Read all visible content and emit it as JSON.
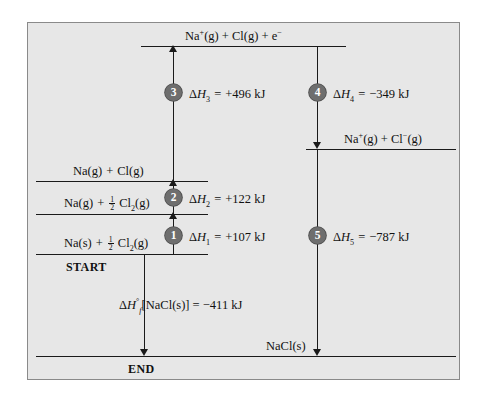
{
  "figure": {
    "type": "born-haber-cycle-energy-diagram",
    "background_color": "#e7e7e7",
    "border_color": "#8a8a8a",
    "line_color": "#1a1a1a",
    "badge_color": "#6e6e6e"
  },
  "levels": {
    "top": {
      "label_html": "Na<sup>+</sup>(g) + Cl(g) + e<sup>&minus;</sup>",
      "name": "Na+(g) + Cl(g) + e-"
    },
    "ion_pair": {
      "label_html": "Na<sup>+</sup>(g) + Cl<sup>&minus;</sup>(g)",
      "name": "Na+(g) + Cl-(g)"
    },
    "atoms": {
      "label_html": "Na(g)<span class=\"sp\"></span>+<span class=\"sp\"></span>Cl(g)",
      "name": "Na(g) + Cl(g)"
    },
    "na_gas": {
      "label_html": "Na(g)<span class=\"sp\"></span>+<span class=\"sp\"></span><span class=\"frac\"><span class=\"num\">1</span><span class=\"den\">2</span></span>&nbsp;Cl<sub>2</sub>(g)",
      "name": "Na(g) + 1/2 Cl2(g)"
    },
    "start": {
      "label_html": "Na(s)<span class=\"sp\"></span>+<span class=\"sp\"></span><span class=\"frac\"><span class=\"num\">1</span><span class=\"den\">2</span></span>&nbsp;Cl<sub>2</sub>(g)",
      "name": "Na(s) + 1/2 Cl2(g)"
    },
    "product": {
      "label_html": "NaCl(s)",
      "name": "NaCl(s)"
    }
  },
  "markers": {
    "start_label": "START",
    "end_label": "END"
  },
  "steps": [
    {
      "number": "1",
      "badge": "1",
      "label_html": "&Delta;<span class=\"it\">H</span><sub>1</sub><span class=\"sp\"></span>=<span class=\"sp\"></span>+107 kJ",
      "symbol": "ΔH1",
      "value": 107,
      "unit": "kJ",
      "sign": "+",
      "direction": "up",
      "name": "sublimation"
    },
    {
      "number": "2",
      "badge": "2",
      "label_html": "&Delta;<span class=\"it\">H</span><sub>2</sub><span class=\"sp\"></span>=<span class=\"sp\"></span>+122 kJ",
      "symbol": "ΔH2",
      "value": 122,
      "unit": "kJ",
      "sign": "+",
      "direction": "up",
      "name": "bond-dissociation"
    },
    {
      "number": "3",
      "badge": "3",
      "label_html": "&Delta;<span class=\"it\">H</span><sub>3</sub><span class=\"sp\"></span>=<span class=\"sp\"></span>+496 kJ",
      "symbol": "ΔH3",
      "value": 496,
      "unit": "kJ",
      "sign": "+",
      "direction": "up",
      "name": "ionization-energy"
    },
    {
      "number": "4",
      "badge": "4",
      "label_html": "&Delta;<span class=\"it\">H</span><sub>4</sub><span class=\"sp\"></span>=<span class=\"sp\"></span>&minus;349 kJ",
      "symbol": "ΔH4",
      "value": -349,
      "unit": "kJ",
      "sign": "-",
      "direction": "down",
      "name": "electron-affinity"
    },
    {
      "number": "5",
      "badge": "5",
      "label_html": "&Delta;<span class=\"it\">H</span><sub>5</sub><span class=\"sp\"></span>=<span class=\"sp\"></span>&minus;787 kJ",
      "symbol": "ΔH5",
      "value": -787,
      "unit": "kJ",
      "sign": "-",
      "direction": "down",
      "name": "lattice-energy"
    }
  ],
  "overall": {
    "label_html": "&Delta;<span class=\"it\">H</span><sup>&deg;</sup><sub class=\"it\">f</sub>[NaCl(s)] = &minus;411 kJ",
    "symbol": "ΔH°f[NaCl(s)]",
    "value": -411,
    "unit": "kJ",
    "direction": "down",
    "name": "enthalpy-of-formation"
  },
  "chart_data": {
    "type": "diagram",
    "ylabel": "Enthalpy",
    "levels": [
      {
        "name": "Na+(g) + Cl(g) + e-",
        "y_px": 45
      },
      {
        "name": "Na+(g) + Cl-(g)",
        "y_px": 148
      },
      {
        "name": "Na(g) + Cl(g)",
        "y_px": 180
      },
      {
        "name": "Na(g) + 1/2 Cl2(g)",
        "y_px": 213
      },
      {
        "name": "Na(s) + 1/2 Cl2(g)",
        "y_px": 253
      },
      {
        "name": "NaCl(s)",
        "y_px": 355
      }
    ],
    "transitions": [
      {
        "step": 1,
        "from": "Na(s) + 1/2 Cl2(g)",
        "to": "Na(g) + 1/2 Cl2(g)",
        "delta_H": 107
      },
      {
        "step": 2,
        "from": "Na(g) + 1/2 Cl2(g)",
        "to": "Na(g) + Cl(g)",
        "delta_H": 122
      },
      {
        "step": 3,
        "from": "Na(g) + Cl(g)",
        "to": "Na+(g) + Cl(g) + e-",
        "delta_H": 496
      },
      {
        "step": 4,
        "from": "Na+(g) + Cl(g) + e-",
        "to": "Na+(g) + Cl-(g)",
        "delta_H": -349
      },
      {
        "step": 5,
        "from": "Na+(g) + Cl-(g)",
        "to": "NaCl(s)",
        "delta_H": -787
      },
      {
        "step": "overall",
        "from": "Na(s) + 1/2 Cl2(g)",
        "to": "NaCl(s)",
        "delta_H": -411
      }
    ]
  }
}
